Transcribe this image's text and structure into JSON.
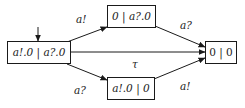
{
  "diagram": {
    "type": "labelled-transition-system",
    "states": [
      {
        "id": "s0",
        "label": "a!.0 | a?.0",
        "initial": true
      },
      {
        "id": "s1",
        "label": "0 | a?.0"
      },
      {
        "id": "s2",
        "label": "a!.0 | 0"
      },
      {
        "id": "s3",
        "label": "0 | 0"
      }
    ],
    "transitions": [
      {
        "from": "s0",
        "to": "s1",
        "label": "a!"
      },
      {
        "from": "s0",
        "to": "s2",
        "label": "a?"
      },
      {
        "from": "s0",
        "to": "s3",
        "label": "τ"
      },
      {
        "from": "s1",
        "to": "s3",
        "label": "a?"
      },
      {
        "from": "s2",
        "to": "s3",
        "label": "a!"
      }
    ]
  }
}
